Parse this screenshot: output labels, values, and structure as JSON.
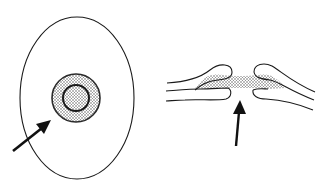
{
  "figure": {
    "background": "#ffffff",
    "stroke_color": "#1a1a1a",
    "stipple_color": "#9a9a9a",
    "panels": [
      {
        "id": "left",
        "description": "Surface view: oval outline with stippled central disc and inner ring, arrow pointing to disc",
        "elements": [
          "oval-outline",
          "stippled-disc",
          "inner-ring",
          "arrow"
        ]
      },
      {
        "id": "right",
        "description": "Cross-section view: two layered folds meeting with stippled bridge between them, arrow pointing up to gap",
        "elements": [
          "left-fold",
          "right-fold",
          "stippled-bridge",
          "arrow"
        ]
      }
    ]
  }
}
